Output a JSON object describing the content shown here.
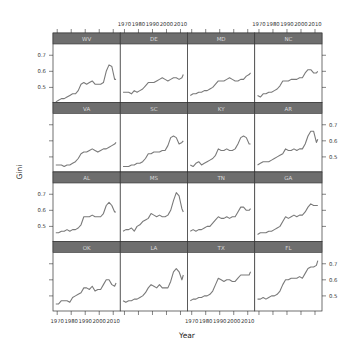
{
  "chart_data": {
    "type": "line",
    "layout": "lattice 4x4",
    "xlabel": "Year",
    "ylabel": "Gini",
    "xlim": [
      1967,
      2015
    ],
    "ylim": [
      0.406,
      0.77
    ],
    "x_ticks": [
      1970,
      1980,
      1990,
      2000,
      2010
    ],
    "y_ticks": [
      0.5,
      0.6,
      0.7
    ],
    "x_tick_labels": [
      "1970",
      "1980",
      "1990",
      "2000",
      "2010"
    ],
    "y_tick_labels": [
      "0.5",
      "0.6",
      "0.7"
    ],
    "x": [
      1969,
      1971,
      1973,
      1975,
      1977,
      1979,
      1981,
      1983,
      1985,
      1987,
      1989,
      1991,
      1993,
      1995,
      1997,
      1999,
      2001,
      2003,
      2005,
      2007,
      2009,
      2011,
      2012
    ],
    "panels": [
      {
        "name": "WV",
        "values": [
          0.41,
          0.42,
          0.43,
          0.43,
          0.44,
          0.45,
          0.46,
          0.46,
          0.48,
          0.52,
          0.53,
          0.52,
          0.53,
          0.54,
          0.52,
          0.52,
          0.52,
          0.53,
          0.6,
          0.64,
          0.63,
          0.55,
          0.55
        ]
      },
      {
        "name": "DE",
        "values": [
          0.47,
          0.47,
          0.47,
          0.46,
          0.48,
          0.47,
          0.48,
          0.49,
          0.51,
          0.53,
          0.53,
          0.53,
          0.54,
          0.55,
          0.56,
          0.55,
          0.54,
          0.55,
          0.56,
          0.56,
          0.55,
          0.56,
          0.58
        ]
      },
      {
        "name": "MD",
        "values": [
          0.45,
          0.46,
          0.46,
          0.47,
          0.47,
          0.48,
          0.48,
          0.49,
          0.5,
          0.52,
          0.54,
          0.54,
          0.54,
          0.55,
          0.56,
          0.55,
          0.54,
          0.54,
          0.55,
          0.55,
          0.57,
          0.58,
          0.59
        ]
      },
      {
        "name": "NC",
        "values": [
          0.45,
          0.44,
          0.46,
          0.46,
          0.47,
          0.47,
          0.48,
          0.49,
          0.51,
          0.54,
          0.54,
          0.54,
          0.55,
          0.55,
          0.55,
          0.56,
          0.56,
          0.59,
          0.61,
          0.61,
          0.59,
          0.59,
          0.6
        ]
      },
      {
        "name": "VA",
        "values": [
          0.45,
          0.45,
          0.45,
          0.44,
          0.45,
          0.45,
          0.46,
          0.47,
          0.49,
          0.52,
          0.53,
          0.53,
          0.54,
          0.55,
          0.54,
          0.53,
          0.54,
          0.55,
          0.55,
          0.56,
          0.57,
          0.58,
          0.59
        ]
      },
      {
        "name": "SC",
        "values": [
          0.44,
          0.44,
          0.44,
          0.45,
          0.45,
          0.46,
          0.46,
          0.47,
          0.49,
          0.52,
          0.52,
          0.53,
          0.53,
          0.53,
          0.54,
          0.54,
          0.57,
          0.62,
          0.63,
          0.62,
          0.58,
          0.59,
          0.6
        ]
      },
      {
        "name": "KY",
        "values": [
          0.45,
          0.44,
          0.46,
          0.47,
          0.45,
          0.46,
          0.47,
          0.48,
          0.49,
          0.51,
          0.55,
          0.54,
          0.54,
          0.55,
          0.54,
          0.54,
          0.55,
          0.58,
          0.62,
          0.63,
          0.62,
          0.58,
          0.58
        ]
      },
      {
        "name": "AR",
        "values": [
          0.45,
          0.46,
          0.47,
          0.47,
          0.47,
          0.48,
          0.49,
          0.5,
          0.51,
          0.52,
          0.55,
          0.54,
          0.54,
          0.55,
          0.54,
          0.55,
          0.55,
          0.58,
          0.63,
          0.66,
          0.66,
          0.59,
          0.61
        ]
      },
      {
        "name": "AL",
        "values": [
          0.46,
          0.46,
          0.47,
          0.47,
          0.48,
          0.47,
          0.48,
          0.48,
          0.49,
          0.51,
          0.56,
          0.56,
          0.56,
          0.57,
          0.56,
          0.56,
          0.56,
          0.58,
          0.63,
          0.65,
          0.63,
          0.59,
          0.59
        ]
      },
      {
        "name": "MS",
        "values": [
          0.47,
          0.48,
          0.48,
          0.49,
          0.47,
          0.5,
          0.51,
          0.53,
          0.54,
          0.55,
          0.58,
          0.57,
          0.56,
          0.57,
          0.56,
          0.56,
          0.57,
          0.6,
          0.66,
          0.71,
          0.69,
          0.61,
          0.59
        ]
      },
      {
        "name": "TN",
        "values": [
          0.47,
          0.48,
          0.47,
          0.48,
          0.48,
          0.49,
          0.5,
          0.5,
          0.52,
          0.54,
          0.56,
          0.55,
          0.55,
          0.56,
          0.55,
          0.56,
          0.56,
          0.59,
          0.62,
          0.62,
          0.6,
          0.6,
          0.61
        ]
      },
      {
        "name": "GA",
        "values": [
          0.45,
          0.46,
          0.46,
          0.46,
          0.47,
          0.47,
          0.48,
          0.49,
          0.5,
          0.53,
          0.56,
          0.55,
          0.56,
          0.57,
          0.56,
          0.57,
          0.57,
          0.59,
          0.62,
          0.64,
          0.63,
          0.63,
          0.63
        ]
      },
      {
        "name": "OK",
        "values": [
          0.45,
          0.45,
          0.47,
          0.47,
          0.47,
          0.46,
          0.49,
          0.5,
          0.51,
          0.52,
          0.55,
          0.55,
          0.54,
          0.56,
          0.53,
          0.54,
          0.54,
          0.57,
          0.6,
          0.6,
          0.57,
          0.56,
          0.58
        ]
      },
      {
        "name": "LA",
        "values": [
          0.47,
          0.46,
          0.47,
          0.47,
          0.48,
          0.48,
          0.49,
          0.5,
          0.52,
          0.55,
          0.57,
          0.56,
          0.55,
          0.57,
          0.55,
          0.55,
          0.55,
          0.59,
          0.65,
          0.67,
          0.65,
          0.6,
          0.63
        ]
      },
      {
        "name": "TX",
        "values": [
          0.47,
          0.48,
          0.48,
          0.49,
          0.49,
          0.5,
          0.5,
          0.51,
          0.53,
          0.57,
          0.61,
          0.6,
          0.59,
          0.6,
          0.6,
          0.59,
          0.59,
          0.61,
          0.63,
          0.63,
          0.63,
          0.63,
          0.65
        ]
      },
      {
        "name": "FL",
        "values": [
          0.48,
          0.48,
          0.49,
          0.48,
          0.49,
          0.5,
          0.5,
          0.51,
          0.53,
          0.57,
          0.6,
          0.6,
          0.61,
          0.61,
          0.61,
          0.62,
          0.61,
          0.64,
          0.67,
          0.68,
          0.68,
          0.69,
          0.72
        ]
      }
    ],
    "grid": false,
    "legend": null,
    "title": ""
  },
  "axes": {
    "xlabel": "Year",
    "ylabel": "Gini"
  }
}
